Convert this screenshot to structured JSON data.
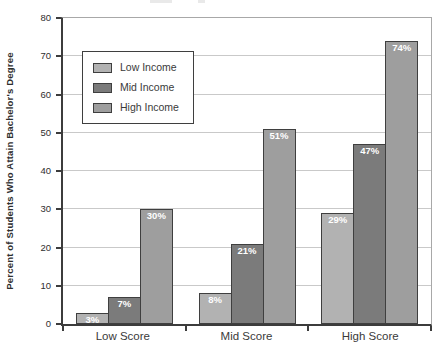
{
  "canvas": {
    "width": 439,
    "height": 359,
    "background": "#ffffff"
  },
  "chart_data": {
    "type": "bar",
    "title": "",
    "xlabel": "",
    "ylabel": "Percent of Students Who Attain Bachelor's Degree",
    "categories": [
      "Low Score",
      "Mid Score",
      "High Score"
    ],
    "series": [
      {
        "name": "Low Income",
        "color": "#b2b2b2",
        "values": [
          3,
          8,
          29
        ],
        "labels": [
          "3%",
          "8%",
          "29%"
        ]
      },
      {
        "name": "Mid Income",
        "color": "#7b7b7b",
        "values": [
          7,
          21,
          47
        ],
        "labels": [
          "7%",
          "21%",
          "47%"
        ]
      },
      {
        "name": "High Income",
        "color": "#9e9e9e",
        "values": [
          30,
          51,
          74
        ],
        "labels": [
          "30%",
          "51%",
          "74%"
        ]
      }
    ],
    "ylim": [
      0,
      80
    ],
    "yticks": [
      0,
      10,
      20,
      30,
      40,
      50,
      60,
      70,
      80
    ],
    "grid": true,
    "legend_position": "upper-left",
    "bar_value_label_color": "#ffffff",
    "bar_border_color": "#3f3f3f",
    "grid_color": "#c9c9c9",
    "axis_color": "#3c3c3c",
    "frame_color": "#a8a8a8"
  }
}
